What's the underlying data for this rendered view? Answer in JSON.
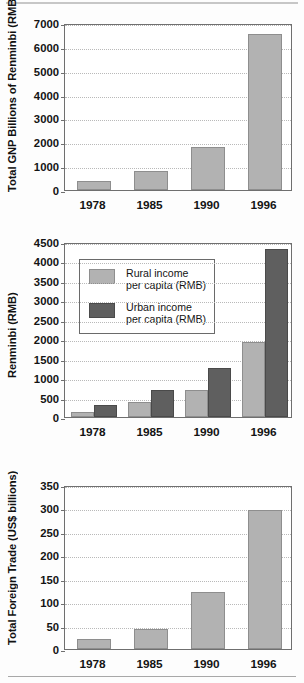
{
  "page": {
    "background": "#fdfdfd",
    "top_rule": true,
    "bottom_rule": true
  },
  "colors": {
    "light_bar": "#b2b2b2",
    "dark_bar": "#5f5f5f",
    "axis": "#6f6f6f",
    "gridline": "#b9b9b9",
    "text": "#141414"
  },
  "chart_data": [
    {
      "id": "gnp",
      "type": "bar",
      "title": "",
      "xlabel": "",
      "ylabel": "Total GNP Billions of Renminbi (RMB)",
      "categories": [
        "1978",
        "1985",
        "1990",
        "1996"
      ],
      "values": [
        360,
        800,
        1790,
        6530
      ],
      "ylim": [
        0,
        7000
      ],
      "yticks": [
        0,
        1000,
        2000,
        3000,
        4000,
        5000,
        6000,
        7000
      ],
      "ytick_labels": [
        "0",
        "1000",
        "2000",
        "3000",
        "4000",
        "5000",
        "6000",
        "7000"
      ],
      "grid": true,
      "legend": null,
      "series": [
        {
          "name": "Total GNP",
          "color": "#b2b2b2",
          "values": [
            360,
            800,
            1790,
            6530
          ]
        }
      ]
    },
    {
      "id": "income",
      "type": "bar",
      "title": "",
      "xlabel": "",
      "ylabel": "Renminbi (RMB)",
      "categories": [
        "1978",
        "1985",
        "1990",
        "1996"
      ],
      "ylim": [
        0,
        4500
      ],
      "yticks": [
        0,
        500,
        1000,
        1500,
        2000,
        2500,
        3000,
        3500,
        4000,
        4500
      ],
      "ytick_labels": [
        "0",
        "500",
        "1000",
        "1500",
        "2000",
        "2500",
        "3000",
        "3500",
        "4000",
        "4500"
      ],
      "grid": true,
      "legend_position": "upper-left",
      "series": [
        {
          "name": "Rural income per capita (RMB)",
          "name_line1": "Rural income",
          "name_line2": "per capita (RMB)",
          "color": "#b2b2b2",
          "values": [
            134,
            398,
            686,
            1926
          ]
        },
        {
          "name": "Urban income per capita (RMB)",
          "name_line1": "Urban income",
          "name_line2": "per capita (RMB)",
          "color": "#5f5f5f",
          "values": [
            316,
            685,
            1270,
            4330
          ]
        }
      ]
    },
    {
      "id": "trade",
      "type": "bar",
      "title": "",
      "xlabel": "",
      "ylabel": "Total Foreign Trade (US$ billions)",
      "categories": [
        "1978",
        "1985",
        "1990",
        "1996"
      ],
      "values": [
        21,
        42,
        122,
        297
      ],
      "ylim": [
        0,
        350
      ],
      "yticks": [
        0,
        50,
        100,
        150,
        200,
        250,
        300,
        350
      ],
      "ytick_labels": [
        "0",
        "50",
        "100",
        "150",
        "200",
        "250",
        "300",
        "350"
      ],
      "grid": true,
      "legend": null,
      "series": [
        {
          "name": "Total Foreign Trade",
          "color": "#b2b2b2",
          "values": [
            21,
            42,
            122,
            297
          ]
        }
      ]
    }
  ]
}
